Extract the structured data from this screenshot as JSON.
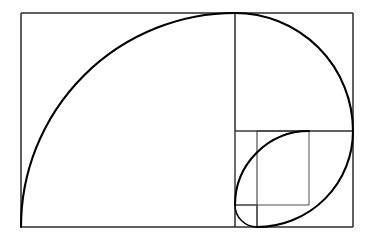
{
  "figure": {
    "type": "geometric-diagram",
    "background_color": "#ffffff",
    "spiral_color": "#000000",
    "grid_color": "#2b2b2b",
    "canvas": {
      "width": 374,
      "height": 243
    },
    "outer_rectangle": {
      "x": 21,
      "y": 13,
      "width": 332,
      "height": 214,
      "label": "golden-rectangle"
    },
    "squares": [
      {
        "index": 1,
        "side": 214,
        "x": 21,
        "y": 13,
        "corner": "bottom-left",
        "arc_from": "bottom-left",
        "arc_to": "top-right"
      },
      {
        "index": 2,
        "side": 131,
        "x": 235,
        "y": 13,
        "corner": "top-left",
        "arc_from": "top-left",
        "arc_to": "bottom-right"
      },
      {
        "index": 3,
        "side": 82,
        "x": 271,
        "y": 144,
        "corner": "top-right",
        "arc_from": "top-right",
        "arc_to": "bottom-left"
      },
      {
        "index": 4,
        "side": 50,
        "x": 235,
        "y": 144,
        "corner": "bottom-right",
        "arc_from": "bottom-right",
        "arc_to": "top-left"
      },
      {
        "index": 5,
        "side": 31,
        "x": 253,
        "y": 144,
        "corner": "bottom-left",
        "arc_from": "bottom-left",
        "arc_to": "top-right"
      },
      {
        "index": 6,
        "side": 19,
        "x": 253,
        "y": 163,
        "corner": "top-left",
        "arc_from": "top-left",
        "arc_to": "bottom-right"
      },
      {
        "index": 7,
        "side": 12,
        "x": 260,
        "y": 163,
        "corner": "top-right",
        "arc_from": "top-right",
        "arc_to": "bottom-left"
      },
      {
        "index": 8,
        "side": 7,
        "x": 253,
        "y": 163,
        "corner": "bottom-right",
        "arc_from": "bottom-right",
        "arc_to": "top-left"
      }
    ],
    "divider_lines": [
      {
        "name": "vertical-main-divider",
        "x1": 235,
        "y1": 13,
        "x2": 235,
        "y2": 227
      },
      {
        "name": "horizontal-secondary",
        "x1": 235,
        "y1": 144,
        "x2": 353,
        "y2": 144
      },
      {
        "name": "vertical-tertiary",
        "x1": 271,
        "y1": 144,
        "x2": 271,
        "y2": 227
      },
      {
        "name": "horizontal-quaternary",
        "x1": 235,
        "y1": 175,
        "x2": 271,
        "y2": 175
      }
    ],
    "ratio": "1.618",
    "fibonacci_sequence": [
      1,
      1,
      2,
      3,
      5,
      8,
      13,
      21,
      34,
      55
    ]
  }
}
